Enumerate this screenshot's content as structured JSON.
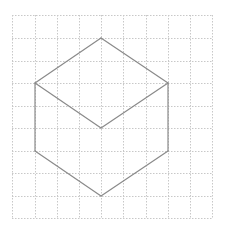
{
  "diagram": {
    "type": "isometric-cube-on-grid",
    "grid": {
      "columns": 9,
      "rows": 9,
      "x_lines": [
        12,
        35,
        57,
        79,
        101,
        123,
        146,
        168,
        190,
        212
      ],
      "y_lines": [
        15,
        38,
        61,
        83,
        106,
        128,
        151,
        173,
        196,
        218
      ],
      "line_color": "#c8c8c8",
      "dash": "1.5,1.5"
    },
    "shape": {
      "stroke_color": "#8a8a8a",
      "stroke_width": 1.2,
      "vertices": {
        "top": [
          101,
          38
        ],
        "left": [
          35,
          83
        ],
        "right": [
          168,
          83
        ],
        "center": [
          101,
          128
        ],
        "lower_left": [
          35,
          151
        ],
        "lower_right": [
          168,
          151
        ],
        "bottom": [
          101,
          196
        ]
      },
      "edges": [
        [
          "top",
          "left"
        ],
        [
          "top",
          "right"
        ],
        [
          "left",
          "center"
        ],
        [
          "right",
          "center"
        ],
        [
          "left",
          "lower_left"
        ],
        [
          "right",
          "lower_right"
        ],
        [
          "lower_left",
          "bottom"
        ],
        [
          "lower_right",
          "bottom"
        ]
      ]
    }
  }
}
